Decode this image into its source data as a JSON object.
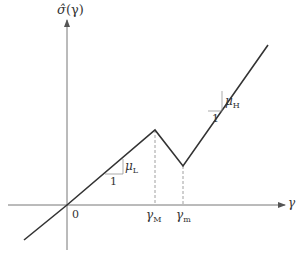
{
  "axes": {
    "y_label_main": "σ̂",
    "y_label_arg": "(γ)",
    "x_label": "γ",
    "origin_label": "0"
  },
  "ticks": {
    "gamma_M": {
      "base": "γ",
      "sub": "M"
    },
    "gamma_m": {
      "base": "γ",
      "sub": "m"
    }
  },
  "slopes": {
    "low": {
      "run": "1",
      "rise_base": "μ",
      "rise_sub": "L"
    },
    "high": {
      "run": "1",
      "rise_base": "μ",
      "rise_sub": "H"
    }
  },
  "colors": {
    "line": "#333333",
    "axis": "#666666",
    "guide": "#888888"
  }
}
